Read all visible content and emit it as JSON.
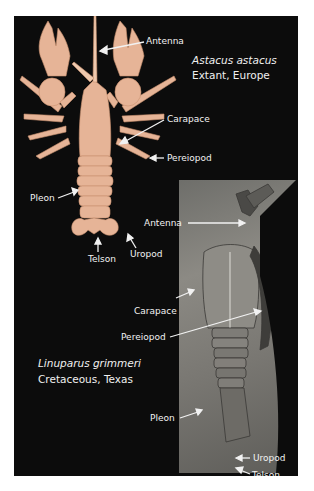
{
  "figure": {
    "background_color": "#0c0c0c",
    "label_color": "#f2f2f2",
    "specimens": [
      {
        "species": "Astacus astacus",
        "status": "Extant, Europe",
        "color": "#e9b99a",
        "labels": [
          "Antenna",
          "Carapace",
          "Pereiopod",
          "Pleon",
          "Telson",
          "Uropod"
        ]
      },
      {
        "species": "Linuparus grimmeri",
        "status": "Cretaceous, Texas",
        "color": "#7a7873",
        "labels": [
          "Antenna",
          "Carapace",
          "Pereiopod",
          "Pleon",
          "Uropod",
          "Telson"
        ]
      }
    ]
  }
}
